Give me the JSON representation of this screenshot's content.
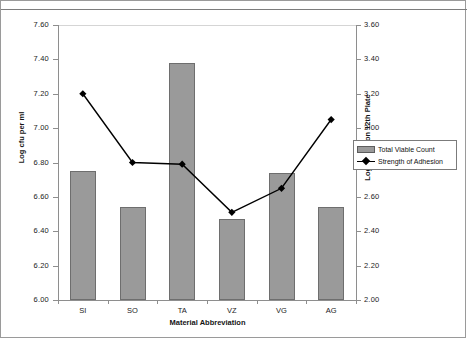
{
  "chart_data": {
    "type": "bar",
    "title": "",
    "xlabel": "Material Abbreviation",
    "ylabel": "Log cfu per ml",
    "ylabel_secondary": "Log Count on 12th Plate",
    "categories": [
      "SI",
      "SO",
      "TA",
      "VZ",
      "VG",
      "AG"
    ],
    "ylim": [
      6.0,
      7.6
    ],
    "ylim_secondary": [
      2.0,
      3.6
    ],
    "yticks": [
      "6.00",
      "6.20",
      "6.40",
      "6.60",
      "6.80",
      "7.00",
      "7.20",
      "7.40",
      "7.60"
    ],
    "yticks_secondary": [
      "2.00",
      "2.20",
      "2.40",
      "2.60",
      "2.80",
      "3.00",
      "3.20",
      "3.40",
      "3.60"
    ],
    "grid": false,
    "legend_position": "right",
    "series": [
      {
        "name": "Total Viable Count",
        "type": "bar",
        "axis": "left",
        "color": "#9a9a9a",
        "values": [
          6.75,
          6.54,
          7.38,
          6.47,
          6.74,
          6.54
        ]
      },
      {
        "name": "Strength of Adhesion",
        "type": "line",
        "axis": "right",
        "color": "#000000",
        "values": [
          3.2,
          2.8,
          2.79,
          2.51,
          2.65,
          3.05
        ]
      }
    ]
  },
  "legend": {
    "items": [
      {
        "label": "Total Viable Count"
      },
      {
        "label": "Strength of Adhesion"
      }
    ]
  }
}
